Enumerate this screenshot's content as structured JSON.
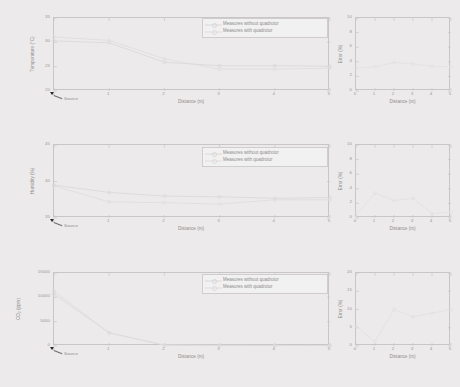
{
  "figure": {
    "background_color": "#eceaea",
    "grid_layout": "3 rows x 2 columns",
    "series_colors": {
      "without_quadrotor": "#d9d7d7",
      "with_quadrotor": "#dedcdc",
      "error": "#e2e0e0"
    },
    "legend_labels": {
      "without": "Measures without quadrotor",
      "with": "Measures with quadrotor"
    },
    "source_annotation": "Source"
  },
  "chart_data": [
    {
      "type": "line",
      "title": "",
      "panel": "temperature-vs-distance",
      "xlabel": "Distance (m)",
      "ylabel": "Temperature (°C)",
      "xlim": [
        0,
        5
      ],
      "ylim": [
        20,
        35
      ],
      "xticks": [
        0,
        1,
        2,
        3,
        4,
        5
      ],
      "yticks": [
        20,
        25,
        30,
        35
      ],
      "xticklabels": [
        "0",
        "1",
        "2",
        "3",
        "4",
        "5"
      ],
      "yticklabels": [
        "20",
        "25",
        "30",
        "35"
      ],
      "grid": false,
      "legend_position": "upper right",
      "x": [
        0,
        1,
        2,
        3,
        4,
        5
      ],
      "series": [
        {
          "name": "Measures without quadrotor",
          "values": [
            30.3,
            29.9,
            25.9,
            25.2,
            25.2,
            25.1
          ]
        },
        {
          "name": "Measures with quadrotor",
          "values": [
            31.1,
            30.4,
            26.6,
            24.5,
            24.5,
            24.7
          ]
        }
      ],
      "annotations": [
        {
          "text": "Source",
          "x": 0,
          "y": 20
        }
      ]
    },
    {
      "type": "line",
      "title": "",
      "panel": "temperature-error",
      "xlabel": "Distance (m)",
      "ylabel": "Error (%)",
      "xlim": [
        0,
        5
      ],
      "ylim": [
        0,
        10
      ],
      "xticks": [
        0,
        1,
        2,
        3,
        4,
        5
      ],
      "yticks": [
        0,
        2,
        4,
        6,
        8,
        10
      ],
      "xticklabels": [
        "0",
        "1",
        "2",
        "3",
        "4",
        "5"
      ],
      "yticklabels": [
        "0",
        "2",
        "4",
        "6",
        "8",
        "10"
      ],
      "grid": false,
      "legend_position": "none",
      "x": [
        0,
        1,
        2,
        3,
        4,
        5
      ],
      "series": [
        {
          "name": "Error",
          "values": [
            3.1,
            3.3,
            3.9,
            3.7,
            3.4,
            3.3
          ]
        }
      ]
    },
    {
      "type": "line",
      "title": "",
      "panel": "humidity-vs-distance",
      "xlabel": "Distance (m)",
      "ylabel": "Humidity (%)",
      "xlim": [
        0,
        5
      ],
      "ylim": [
        35,
        45
      ],
      "xticks": [
        0,
        1,
        2,
        3,
        4,
        5
      ],
      "yticks": [
        35,
        40,
        45
      ],
      "xticklabels": [
        "0",
        "1",
        "2",
        "3",
        "4",
        "5"
      ],
      "yticklabels": [
        "35",
        "40",
        "45"
      ],
      "grid": false,
      "legend_position": "upper right",
      "x": [
        0,
        1,
        2,
        3,
        4,
        5
      ],
      "series": [
        {
          "name": "Measures without quadrotor",
          "values": [
            39.5,
            38.5,
            38.0,
            37.9,
            37.7,
            37.8
          ]
        },
        {
          "name": "Measures with quadrotor",
          "values": [
            39.4,
            37.2,
            37.1,
            36.9,
            37.5,
            37.5
          ]
        }
      ],
      "annotations": [
        {
          "text": "Source",
          "x": 0,
          "y": 35
        }
      ]
    },
    {
      "type": "line",
      "title": "",
      "panel": "humidity-error",
      "xlabel": "Distance (m)",
      "ylabel": "Error (%)",
      "xlim": [
        0,
        5
      ],
      "ylim": [
        0,
        10
      ],
      "xticks": [
        0,
        1,
        2,
        3,
        4,
        5
      ],
      "yticks": [
        0,
        2,
        4,
        6,
        8,
        10
      ],
      "xticklabels": [
        "0",
        "1",
        "2",
        "3",
        "4",
        "5"
      ],
      "yticklabels": [
        "0",
        "2",
        "4",
        "6",
        "8",
        "10"
      ],
      "grid": false,
      "legend_position": "none",
      "x": [
        0,
        1,
        2,
        3,
        4,
        5
      ],
      "series": [
        {
          "name": "Error",
          "values": [
            0.4,
            3.4,
            2.4,
            2.7,
            0.6,
            0.8
          ]
        }
      ]
    },
    {
      "type": "line",
      "title": "",
      "panel": "co2-vs-distance",
      "xlabel": "Distance (m)",
      "ylabel": "CO₂ (ppm)",
      "xlim": [
        0,
        5
      ],
      "ylim": [
        0,
        15000
      ],
      "xticks": [
        0,
        1,
        2,
        3,
        4,
        5
      ],
      "yticks": [
        0,
        5000,
        10000,
        15000
      ],
      "xticklabels": [
        "0",
        "1",
        "2",
        "3",
        "4",
        "5"
      ],
      "yticklabels": [
        "0",
        "5000",
        "10000",
        "15000"
      ],
      "grid": false,
      "legend_position": "upper right",
      "x": [
        0,
        1,
        2,
        3,
        4,
        5
      ],
      "series": [
        {
          "name": "Measures without quadrotor",
          "values": [
            10700,
            2700,
            180,
            120,
            100,
            90
          ]
        },
        {
          "name": "Measures with quadrotor",
          "values": [
            11300,
            2700,
            200,
            130,
            110,
            100
          ]
        }
      ],
      "annotations": [
        {
          "text": "Source",
          "x": 0,
          "y": 0
        }
      ]
    },
    {
      "type": "line",
      "title": "",
      "panel": "co2-error",
      "xlabel": "Distance (m)",
      "ylabel": "Error (%)",
      "xlim": [
        0,
        5
      ],
      "ylim": [
        0,
        20
      ],
      "xticks": [
        0,
        1,
        2,
        3,
        4,
        5
      ],
      "yticks": [
        0,
        5,
        10,
        15,
        20
      ],
      "xticklabels": [
        "0",
        "1",
        "2",
        "3",
        "4",
        "5"
      ],
      "yticklabels": [
        "0",
        "5",
        "10",
        "15",
        "20"
      ],
      "grid": false,
      "legend_position": "none",
      "x": [
        0,
        1,
        2,
        3,
        4,
        5
      ],
      "series": [
        {
          "name": "Error",
          "values": [
            5.5,
            1.2,
            10.0,
            8.0,
            9.0,
            10.0
          ]
        }
      ]
    }
  ]
}
